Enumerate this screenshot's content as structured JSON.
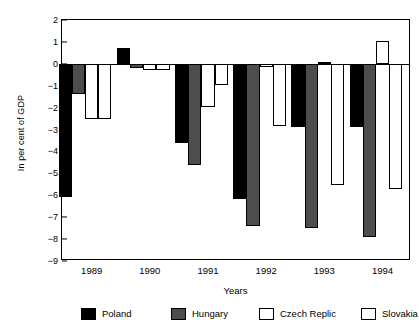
{
  "chart_data": {
    "type": "bar",
    "title": "",
    "xlabel": "Years",
    "ylabel": "In per cent of GDP",
    "categories": [
      "1989",
      "1990",
      "1991",
      "1992",
      "1993",
      "1994"
    ],
    "ylim": [
      -9,
      2
    ],
    "yticks": [
      2,
      1,
      0,
      -1,
      -2,
      -3,
      -4,
      -5,
      -6,
      -7,
      -8,
      -9
    ],
    "ytick_labels": [
      "2",
      "1",
      "0",
      "−1",
      "−2",
      "−3",
      "−4",
      "−5",
      "−6",
      "−7",
      "−8",
      "−9"
    ],
    "grid": false,
    "legend_position": "bottom",
    "series": [
      {
        "name": "Poland",
        "key": "poland",
        "color": "#000000",
        "fill": "solid-black",
        "values": [
          -6.1,
          0.7,
          -3.6,
          -6.15,
          -2.9,
          -2.9
        ]
      },
      {
        "name": "Hungary",
        "key": "hungary",
        "color": "#4d4d4d",
        "fill": "dark-grey",
        "values": [
          -1.4,
          -0.2,
          -4.6,
          -7.4,
          -7.5,
          -7.9
        ]
      },
      {
        "name": "Czech Replic",
        "key": "czech",
        "color": "#ffffff",
        "fill": "white-outline",
        "values": [
          -2.5,
          -0.3,
          -1.95,
          -0.15,
          0.1,
          1.05
        ]
      },
      {
        "name": "Slovakia",
        "key": "slovakia",
        "color": "#ffffff",
        "fill": "white-outline",
        "values": [
          -2.5,
          -0.3,
          -0.95,
          -2.85,
          -5.55,
          -5.7
        ]
      }
    ]
  },
  "legend": {
    "items": [
      {
        "label": "Poland",
        "key": "poland"
      },
      {
        "label": "Hungary",
        "key": "hungary"
      },
      {
        "label": "Czech Replic",
        "key": "czech"
      },
      {
        "label": "Slovakia",
        "key": "slovakia"
      }
    ]
  }
}
